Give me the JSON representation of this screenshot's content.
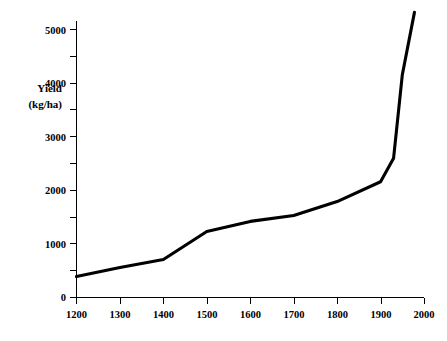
{
  "chart_data": {
    "type": "line",
    "title": "",
    "xlabel": "",
    "ylabel": "Yield (kg/ha)",
    "ylabel_line1": "Yield",
    "ylabel_line2": "(kg/ha)",
    "xlim": [
      1200,
      2000
    ],
    "ylim": [
      0,
      5500
    ],
    "grid": false,
    "legend": "none",
    "x_ticks": [
      1200,
      1300,
      1400,
      1500,
      1600,
      1700,
      1800,
      1900,
      2000
    ],
    "x_tick_labels": [
      "1200",
      "1300",
      "1400",
      "1500",
      "1600",
      "1700",
      "1800",
      "1900",
      "2000"
    ],
    "y_ticks": [
      0,
      500,
      1000,
      1500,
      2000,
      2500,
      3000,
      3500,
      4000,
      4500,
      5000
    ],
    "y_tick_labels": [
      "0",
      "",
      "1000",
      "",
      "2000",
      "",
      "3000",
      "",
      "4000",
      "",
      "5000"
    ],
    "y_major_ticks": [
      0,
      1000,
      2000,
      3000,
      4000,
      5000
    ],
    "series": [
      {
        "name": "Yield",
        "color": "#000000",
        "x": [
          1200,
          1300,
          1400,
          1500,
          1600,
          1700,
          1800,
          1900,
          1930,
          1950,
          1978
        ],
        "values": [
          390,
          560,
          710,
          1230,
          1420,
          1530,
          1790,
          2160,
          2600,
          4150,
          5320
        ]
      }
    ]
  },
  "axes": {
    "x_axis_label": "x-axis-years",
    "y_axis_label": "y-axis-yield"
  }
}
